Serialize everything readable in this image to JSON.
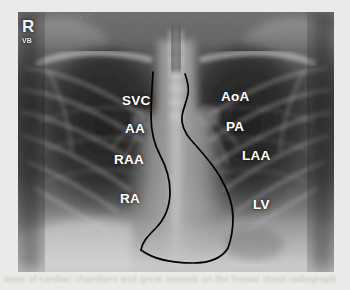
{
  "page": {
    "caption_line": "ation of cardiac chambers and great vessels on the frontal chest radiograph",
    "caption_line_faint": ""
  },
  "radiograph": {
    "modality_note": "chest-xray-pa",
    "side_marker": {
      "primary": "R",
      "secondary": "VB"
    },
    "header_text": "PA CHEST",
    "border_color": "#000000",
    "label_color": "#ffffff"
  },
  "labels": [
    {
      "id": "svc",
      "text": "SVC",
      "x": 104,
      "y": 82,
      "side": "right",
      "full": "superior vena cava"
    },
    {
      "id": "aa",
      "text": "AA",
      "x": 107,
      "y": 110,
      "side": "right",
      "full": "ascending aorta"
    },
    {
      "id": "raa",
      "text": "RAA",
      "x": 96,
      "y": 141,
      "side": "right",
      "full": "right atrial appendage"
    },
    {
      "id": "ra",
      "text": "RA",
      "x": 102,
      "y": 180,
      "side": "right",
      "full": "right atrium"
    },
    {
      "id": "aoa",
      "text": "AoA",
      "x": 203,
      "y": 78,
      "side": "left",
      "full": "aortic arch"
    },
    {
      "id": "pa",
      "text": "PA",
      "x": 208,
      "y": 108,
      "side": "left",
      "full": "pulmonary artery"
    },
    {
      "id": "laa",
      "text": "LAA",
      "x": 224,
      "y": 137,
      "side": "left",
      "full": "left atrial appendage"
    },
    {
      "id": "lv",
      "text": "LV",
      "x": 235,
      "y": 186,
      "side": "left",
      "full": "left ventricle"
    }
  ],
  "contours": {
    "right_heart_border": "M 135,60 C 134,76 133,90 133,104 C 133,120 136,132 142,143 C 149,156 152,168 152,180 C 152,196 146,208 137,217 C 130,224 124,230 123,238",
    "left_heart_border": "M 167,62 C 170,70 171,76 170,82 C 168,92 165,97 164,104 C 163,114 167,121 173,128 C 183,139 193,150 201,163 C 210,178 215,193 215,206 C 215,218 213,228 210,236",
    "inferior_border": "M 123,238 C 135,247 155,251 175,251 C 192,251 204,246 210,236"
  }
}
